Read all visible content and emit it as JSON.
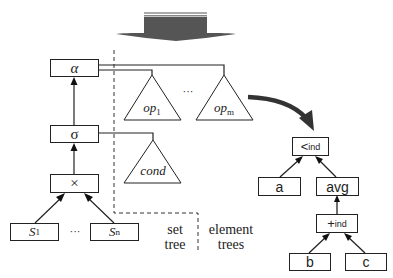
{
  "set_tree": {
    "alpha": "α",
    "sigma": "σ",
    "cross": "×",
    "leaves": [
      {
        "base": "S",
        "sub": "1"
      },
      {
        "base": "S",
        "sub": "n"
      }
    ],
    "leaf_ellipsis": "···"
  },
  "element_trees": {
    "op_first": {
      "base": "op",
      "sub": "1"
    },
    "op_last": {
      "base": "op",
      "sub": "m"
    },
    "op_ellipsis": "···",
    "cond": "cond"
  },
  "expanded_tree": {
    "root": {
      "base": "<",
      "sub": "ind"
    },
    "left": "a",
    "right": "avg",
    "plus": {
      "base": "+",
      "sub": "ind"
    },
    "plus_left": "b",
    "plus_right": "c"
  },
  "region_labels": {
    "set_line1": "set",
    "set_line2": "tree",
    "element_line1": "element",
    "element_line2": "trees"
  },
  "colors": {
    "stroke": "#222222",
    "big_arrow": "#555555",
    "big_arrow_highlight": "#aaaaaa",
    "curve_arrow": "#333333"
  }
}
